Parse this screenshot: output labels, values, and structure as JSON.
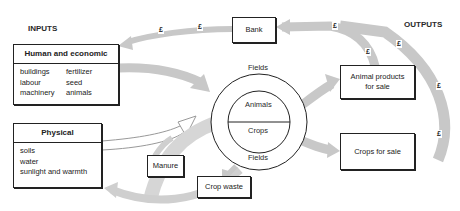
{
  "headings": {
    "inputs": "INPUTS",
    "outputs": "OUTPUTS"
  },
  "boxes": {
    "bank": "Bank",
    "human_economic": {
      "title": "Human and economic",
      "items": [
        "buildings",
        "fertilizer",
        "labour",
        "seed",
        "machinery",
        "animals"
      ]
    },
    "physical": {
      "title": "Physical",
      "items": [
        "soils",
        "water",
        "sunlight and warmth"
      ]
    },
    "animal_products": "Animal products for sale",
    "crops_for_sale": "Crops for sale",
    "manure": "Manure",
    "crop_waste": "Crop waste"
  },
  "farm": {
    "outer_top": "Fields",
    "outer_bottom": "Fields",
    "inner_top": "Animals",
    "inner_bottom": "Crops"
  },
  "money_symbol": "£",
  "colors": {
    "arrow": "#c8c8c8",
    "border": "#222222",
    "text": "#2a2a2a"
  }
}
